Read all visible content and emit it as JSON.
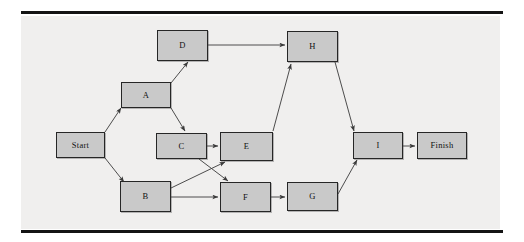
{
  "figure": {
    "type": "flowchart-diagram",
    "panel_background": "#f0efee",
    "node_fill": "#c9c9c9",
    "node_border": "#262626",
    "edge_color": "#3a3a3a",
    "rule_color": "#141414"
  },
  "nodes": [
    {
      "id": "start",
      "label": "Start",
      "x": 35,
      "y": 116,
      "w": 49,
      "h": 26
    },
    {
      "id": "a",
      "label": "A",
      "x": 100,
      "y": 66,
      "w": 50,
      "h": 26
    },
    {
      "id": "b",
      "label": "B",
      "x": 99,
      "y": 165,
      "w": 51,
      "h": 31
    },
    {
      "id": "c",
      "label": "C",
      "x": 135,
      "y": 117,
      "w": 51,
      "h": 26
    },
    {
      "id": "d",
      "label": "D",
      "x": 136,
      "y": 14,
      "w": 51,
      "h": 31
    },
    {
      "id": "e",
      "label": "E",
      "x": 199,
      "y": 116,
      "w": 53,
      "h": 29
    },
    {
      "id": "f",
      "label": "F",
      "x": 199,
      "y": 166,
      "w": 51,
      "h": 30
    },
    {
      "id": "g",
      "label": "G",
      "x": 266,
      "y": 166,
      "w": 51,
      "h": 29
    },
    {
      "id": "h",
      "label": "H",
      "x": 266,
      "y": 15,
      "w": 51,
      "h": 31
    },
    {
      "id": "i",
      "label": "I",
      "x": 332,
      "y": 116,
      "w": 50,
      "h": 27
    },
    {
      "id": "finish",
      "label": "Finish",
      "x": 396,
      "y": 116,
      "w": 50,
      "h": 27
    }
  ],
  "edges": [
    {
      "from": "start",
      "to": "a",
      "x1": 84,
      "y1": 116,
      "x2": 100,
      "y2": 92
    },
    {
      "from": "start",
      "to": "b",
      "x1": 84,
      "y1": 142,
      "x2": 103,
      "y2": 166
    },
    {
      "from": "a",
      "to": "d",
      "x1": 150,
      "y1": 67,
      "x2": 167,
      "y2": 46
    },
    {
      "from": "a",
      "to": "c",
      "x1": 150,
      "y1": 92,
      "x2": 164,
      "y2": 115
    },
    {
      "from": "d",
      "to": "h",
      "x1": 187,
      "y1": 29,
      "x2": 264,
      "y2": 29
    },
    {
      "from": "c",
      "to": "e",
      "x1": 186,
      "y1": 130,
      "x2": 197,
      "y2": 130
    },
    {
      "from": "c",
      "to": "f",
      "x1": 178,
      "y1": 143,
      "x2": 207,
      "y2": 165
    },
    {
      "from": "b",
      "to": "e",
      "x1": 150,
      "y1": 172,
      "x2": 204,
      "y2": 146
    },
    {
      "from": "b",
      "to": "f",
      "x1": 150,
      "y1": 181,
      "x2": 197,
      "y2": 181
    },
    {
      "from": "e",
      "to": "h",
      "x1": 252,
      "y1": 115,
      "x2": 270,
      "y2": 48
    },
    {
      "from": "f",
      "to": "g",
      "x1": 250,
      "y1": 181,
      "x2": 264,
      "y2": 181
    },
    {
      "from": "g",
      "to": "i",
      "x1": 317,
      "y1": 178,
      "x2": 336,
      "y2": 144
    },
    {
      "from": "h",
      "to": "i",
      "x1": 314,
      "y1": 46,
      "x2": 333,
      "y2": 115
    },
    {
      "from": "i",
      "to": "finish",
      "x1": 382,
      "y1": 130,
      "x2": 394,
      "y2": 130
    }
  ]
}
